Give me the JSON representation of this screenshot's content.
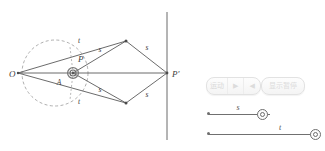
{
  "figure": {
    "stroke_color": "#5a5a5a",
    "dash_color": "#9a9a9a",
    "label_color": "#3d3d3d",
    "points": [
      {
        "id": "O",
        "label": "O",
        "x": 18,
        "y": 73,
        "label_x": 9,
        "label_y": 77
      },
      {
        "id": "P",
        "label": "P",
        "x": 73,
        "y": 73,
        "label_x": 78,
        "label_y": 62
      },
      {
        "id": "Pp",
        "label": "P′",
        "x": 167,
        "y": 73,
        "label_x": 172,
        "label_y": 77
      },
      {
        "id": "V1",
        "label": "",
        "x": 126,
        "y": 41,
        "label_x": 0,
        "label_y": 0
      },
      {
        "id": "V2",
        "label": "",
        "x": 126,
        "y": 103,
        "label_x": 0,
        "label_y": 0
      }
    ],
    "edge_labels": [
      {
        "text": "t",
        "x": 79,
        "y": 43
      },
      {
        "text": "t",
        "x": 79,
        "y": 104
      },
      {
        "text": "s",
        "x": 100,
        "y": 52
      },
      {
        "text": "s",
        "x": 100,
        "y": 92
      },
      {
        "text": "s",
        "x": 147,
        "y": 50
      },
      {
        "text": "s",
        "x": 147,
        "y": 97
      },
      {
        "text": "A",
        "x": 59,
        "y": 85
      }
    ],
    "circle": {
      "cx": 55,
      "cy": 73,
      "r": 33,
      "dashed": true
    },
    "mirror_line": {
      "x": 167,
      "y1": 12,
      "y2": 140
    }
  },
  "panel": {
    "animate_button": {
      "label": "运动",
      "play_glyph": "▶",
      "reverse_glyph": "◀"
    },
    "show_pause_button": {
      "label": "显示暂停"
    },
    "sliders": [
      {
        "id": "s",
        "label": "s",
        "x": 5,
        "y": 30,
        "width": 62,
        "value_pos": 54,
        "label_pos": 30
      },
      {
        "id": "t",
        "label": "t",
        "x": 5,
        "y": 50,
        "width": 112,
        "value_pos": 107,
        "label_pos": 72
      }
    ]
  }
}
